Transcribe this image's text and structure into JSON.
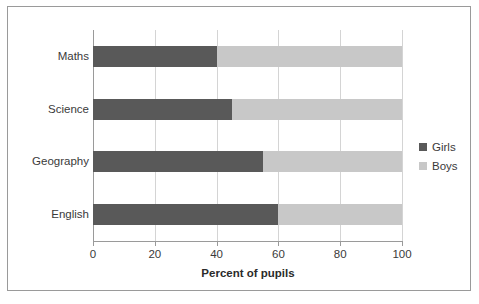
{
  "chart_data": {
    "type": "bar",
    "orientation": "horizontal",
    "stacked": true,
    "title": "",
    "xlabel": "Percent of pupils",
    "ylabel": "",
    "xlim": [
      0,
      100
    ],
    "xticks": [
      0,
      20,
      40,
      60,
      80,
      100
    ],
    "xtick_labels": [
      "0",
      "20",
      "40",
      "60",
      "80",
      "100"
    ],
    "categories": [
      "Maths",
      "Science",
      "Geography",
      "English"
    ],
    "grid": "vertical",
    "legend_position": "right",
    "series": [
      {
        "name": "Girls",
        "color": "#595959",
        "values": [
          40,
          45,
          55,
          60
        ]
      },
      {
        "name": "Boys",
        "color": "#c8c8c8",
        "values": [
          60,
          55,
          45,
          40
        ]
      }
    ]
  },
  "legend": {
    "entries": [
      {
        "label": "Girls"
      },
      {
        "label": "Boys"
      }
    ]
  },
  "colors": {
    "girls": "#595959",
    "boys": "#c8c8c8",
    "frame": "#9a9a9a",
    "gridline": "#d4d4d4",
    "text": "#3a3a3a"
  }
}
